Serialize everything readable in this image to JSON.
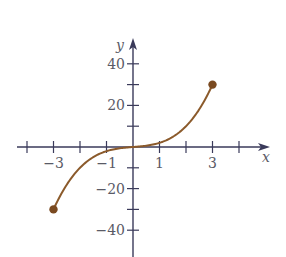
{
  "chart_data": {
    "type": "line",
    "title": "",
    "xlabel": "x",
    "ylabel": "y",
    "xlim": [
      -4.3,
      4.9
    ],
    "ylim": [
      -52,
      52
    ],
    "grid": false,
    "legend": null,
    "x_ticks": [
      -4,
      -3,
      -2,
      -1,
      1,
      2,
      3,
      4
    ],
    "x_tick_labels": [
      {
        "value": -3,
        "label": "−3"
      },
      {
        "value": -1,
        "label": "−1"
      },
      {
        "value": 1,
        "label": "1"
      },
      {
        "value": 3,
        "label": "3"
      }
    ],
    "y_ticks": [
      -40,
      -30,
      -20,
      -10,
      10,
      20,
      30,
      40
    ],
    "y_tick_labels": [
      {
        "value": 40,
        "label": "40"
      },
      {
        "value": 20,
        "label": "20"
      },
      {
        "value": -20,
        "label": "−20"
      },
      {
        "value": -40,
        "label": "−40"
      }
    ],
    "series": [
      {
        "name": "curve",
        "color": "#8b5a2b",
        "x": [
          -3,
          -2.5,
          -2,
          -1.5,
          -1,
          -0.5,
          0,
          0.5,
          1,
          1.5,
          2,
          2.5,
          3
        ],
        "y": [
          -30,
          -18.1,
          -10,
          -4.9,
          -2,
          -0.6,
          0,
          0.6,
          2,
          4.9,
          10,
          18.1,
          30
        ]
      }
    ],
    "endpoints": [
      {
        "x": -3,
        "y": -30,
        "style": "closed-dot"
      },
      {
        "x": 3,
        "y": 30,
        "style": "closed-dot"
      }
    ]
  },
  "colors": {
    "axis": "#3a3a5a",
    "curve": "#8b5a2b",
    "dot": "#7a4a20",
    "label": "#5a5a66"
  }
}
